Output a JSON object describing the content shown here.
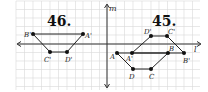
{
  "figures": [
    {
      "title": "46.",
      "points": {
        "B'": {
          "label": "B'",
          "x": 33,
          "y": 34
        },
        "A'": {
          "label": "A'",
          "x": 83,
          "y": 34
        },
        "C'": {
          "label": "C'",
          "x": 50,
          "y": 52
        },
        "D'": {
          "label": "D'",
          "x": 67,
          "y": 52
        }
      }
    },
    {
      "title": "45.",
      "points": {
        "A": {
          "label": "A",
          "x": 117,
          "y": 53
        },
        "A'": {
          "label": "A'",
          "x": 132,
          "y": 53
        },
        "B": {
          "label": "B",
          "x": 168,
          "y": 53
        },
        "B'": {
          "label": "B'",
          "x": 184,
          "y": 53
        },
        "C": {
          "label": "C",
          "x": 151,
          "y": 69
        },
        "D": {
          "label": "D",
          "x": 133,
          "y": 69
        },
        "C'": {
          "label": "C'",
          "x": 167,
          "y": 36
        },
        "D'": {
          "label": "D'",
          "x": 151,
          "y": 36
        }
      }
    }
  ],
  "axes": {
    "vertical_label": "m",
    "horizontal_label": "l"
  },
  "colors": {
    "grid": "#d9d9d9",
    "ink": "#222222",
    "background": "#ffffff"
  }
}
